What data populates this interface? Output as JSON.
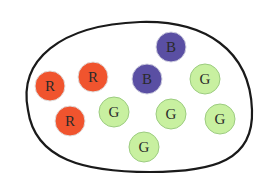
{
  "diagram": {
    "type": "set-of-colored-balls",
    "boundary": {
      "stroke": "#1a1a1a"
    },
    "colors": {
      "R": "#f0542e",
      "B": "#5a4fa3",
      "G": "#c8f0a0"
    },
    "stroke_colors": {
      "R": "#e0e0e0",
      "B": "#d0d0e0",
      "G": "#9ccc80"
    },
    "counts": {
      "R": 3,
      "B": 2,
      "G": 6
    },
    "balls": [
      {
        "label": "R",
        "cx": 50,
        "cy": 86,
        "r": 15
      },
      {
        "label": "R",
        "cx": 93,
        "cy": 77,
        "r": 15
      },
      {
        "label": "R",
        "cx": 70,
        "cy": 121,
        "r": 15
      },
      {
        "label": "G",
        "cx": 114,
        "cy": 112,
        "r": 15
      },
      {
        "label": "B",
        "cx": 171,
        "cy": 47,
        "r": 15
      },
      {
        "label": "B",
        "cx": 147,
        "cy": 79,
        "r": 15
      },
      {
        "label": "G",
        "cx": 205,
        "cy": 79,
        "r": 15
      },
      {
        "label": "G",
        "cx": 171,
        "cy": 114,
        "r": 15
      },
      {
        "label": "G",
        "cx": 220,
        "cy": 119,
        "r": 15
      },
      {
        "label": "G",
        "cx": 144,
        "cy": 147,
        "r": 15
      }
    ]
  }
}
